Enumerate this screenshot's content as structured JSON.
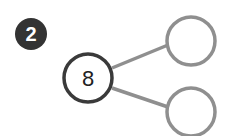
{
  "problem": {
    "number": "2"
  },
  "number_bond": {
    "whole": "8",
    "parts": [
      "",
      ""
    ]
  },
  "colors": {
    "badge_fill": "#333333",
    "whole_stroke": "#3a3a3a",
    "part_stroke": "#8f8f8f",
    "connector_stroke": "#8f8f8f"
  }
}
